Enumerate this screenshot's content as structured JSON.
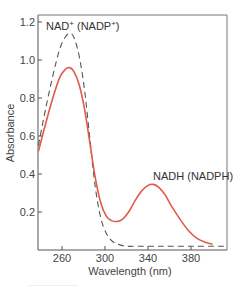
{
  "chart_data": {
    "type": "line",
    "title": "",
    "xlabel": "Wavelength (nm)",
    "ylabel": "Absorbance",
    "xlim": [
      238,
      413
    ],
    "ylim": [
      0,
      1.24
    ],
    "xticks": [
      260,
      300,
      340,
      380
    ],
    "yticks": [
      0.2,
      0.4,
      0.6,
      0.8,
      1.0,
      1.2
    ],
    "xtick_labels": [
      "260",
      "300",
      "340",
      "380"
    ],
    "ytick_labels": [
      "0.2",
      "0.4",
      "0.6",
      "0.8",
      "1.0",
      "1.2"
    ],
    "grid": false,
    "legend": "none",
    "series": [
      {
        "name": "NAD+ (NADP+)",
        "style": "dashed",
        "color": "#555555",
        "x": [
          238,
          245,
          252,
          258,
          263,
          267,
          271,
          276,
          281,
          286,
          291,
          296,
          301,
          306,
          312,
          320,
          330,
          345,
          360,
          380,
          400,
          413
        ],
        "y": [
          0.55,
          0.75,
          0.93,
          1.06,
          1.12,
          1.14,
          1.12,
          1.02,
          0.84,
          0.58,
          0.33,
          0.17,
          0.09,
          0.05,
          0.03,
          0.02,
          0.02,
          0.02,
          0.02,
          0.02,
          0.02,
          0.02
        ]
      },
      {
        "name": "NADH (NADPH)",
        "style": "solid",
        "color": "#e05a4a",
        "x": [
          238,
          245,
          252,
          258,
          263,
          267,
          271,
          276,
          281,
          286,
          291,
          296,
          301,
          306,
          311,
          316,
          322,
          328,
          334,
          340,
          345,
          350,
          356,
          362,
          370,
          378,
          386,
          394,
          400
        ],
        "y": [
          0.52,
          0.67,
          0.81,
          0.91,
          0.95,
          0.96,
          0.94,
          0.87,
          0.74,
          0.56,
          0.38,
          0.25,
          0.18,
          0.155,
          0.15,
          0.16,
          0.2,
          0.26,
          0.31,
          0.34,
          0.345,
          0.33,
          0.29,
          0.23,
          0.16,
          0.1,
          0.06,
          0.04,
          0.03
        ]
      }
    ],
    "annotations": [
      {
        "text": "NAD",
        "sup": "+",
        "text2": " (NADP",
        "sup2": "+",
        "text3": ")",
        "x": 266,
        "y": 1.17
      },
      {
        "text": "NADH (NADPH)",
        "x": 345,
        "y": 0.37
      }
    ]
  },
  "labels": {
    "xlabel": "Wavelength (nm)",
    "ylabel": "Absorbance",
    "annot1_a": "NAD",
    "annot1_sup": "+",
    "annot1_b": " (NADP",
    "annot1_sup2": "+",
    "annot1_c": ")",
    "annot2": "NADH (NADPH)"
  }
}
